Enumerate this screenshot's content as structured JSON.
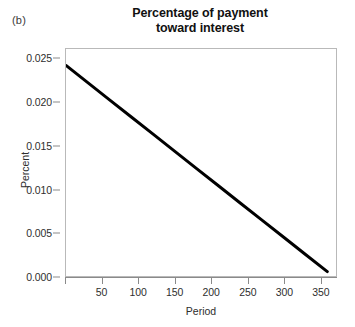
{
  "figure": {
    "panel_label": "(b)",
    "background_color": "#ffffff",
    "width": 355,
    "height": 327
  },
  "chart_data": {
    "type": "line",
    "title": "Percentage of payment toward interest",
    "title_lines": [
      "Percentage of payment",
      "toward interest"
    ],
    "xlabel": "Period",
    "ylabel": "Percent",
    "xlim": [
      0,
      372
    ],
    "ylim": [
      0.0,
      0.0262
    ],
    "grid": false,
    "legend": null,
    "xticks": [
      0,
      50,
      100,
      150,
      200,
      250,
      300,
      350
    ],
    "xticklabels": [
      "",
      "50",
      "100",
      "150",
      "200",
      "250",
      "300",
      "350"
    ],
    "yticks": [
      0.0,
      0.005,
      0.01,
      0.015,
      0.02,
      0.025
    ],
    "yticklabels": [
      "0.000",
      "0.005",
      "0.010",
      "0.015",
      "0.020",
      "0.025"
    ],
    "series": [
      {
        "name": "Percentage of payment toward interest",
        "color": "#000000",
        "linewidth": 3,
        "x": [
          0,
          30,
          60,
          90,
          120,
          150,
          180,
          210,
          240,
          270,
          300,
          330,
          360
        ],
        "values": [
          0.0243,
          0.02232,
          0.02033,
          0.01835,
          0.01637,
          0.01438,
          0.0124,
          0.01042,
          0.00843,
          0.00645,
          0.00447,
          0.00248,
          0.0005
        ]
      }
    ],
    "annotations": []
  }
}
